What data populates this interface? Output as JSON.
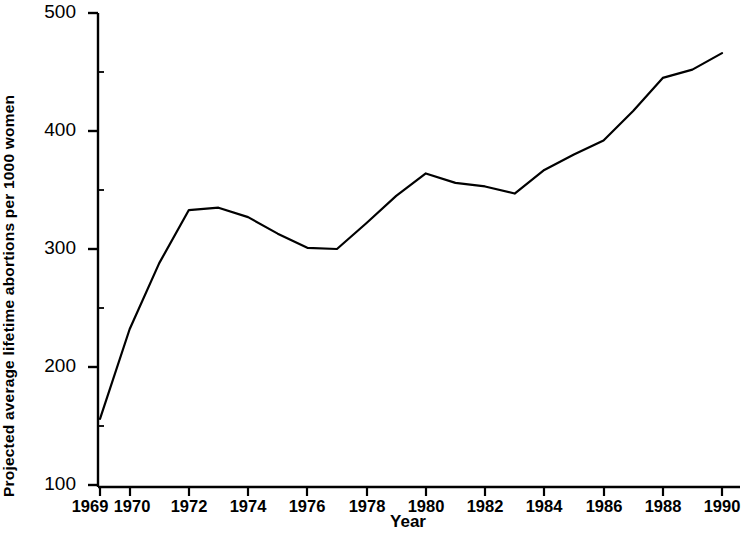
{
  "chart_data": {
    "type": "line",
    "title": "",
    "xlabel": "Year",
    "ylabel": "Projected average lifetime abortions per 1000 women",
    "x": [
      1969,
      1970,
      1971,
      1972,
      1973,
      1974,
      1975,
      1976,
      1977,
      1978,
      1979,
      1980,
      1981,
      1982,
      1983,
      1984,
      1985,
      1986,
      1987,
      1988,
      1989,
      1990
    ],
    "values": [
      156,
      232,
      288,
      333,
      335,
      327,
      313,
      301,
      300,
      322,
      345,
      364,
      356,
      353,
      347,
      367,
      380,
      392,
      417,
      445,
      452,
      466
    ],
    "series": [
      {
        "name": "Projected average lifetime abortions per 1000 women",
        "values": [
          156,
          232,
          288,
          333,
          335,
          327,
          313,
          301,
          300,
          322,
          345,
          364,
          356,
          353,
          347,
          367,
          380,
          392,
          417,
          445,
          452,
          466
        ]
      }
    ],
    "xlim": [
      1969,
      1990
    ],
    "ylim": [
      100,
      500
    ],
    "xticks": [
      1969,
      1970,
      1972,
      1974,
      1976,
      1978,
      1980,
      1982,
      1984,
      1986,
      1988,
      1990
    ],
    "xtick_labels": [
      "1969",
      "1970",
      "1972",
      "1974",
      "1976",
      "1978",
      "1980",
      "1982",
      "1984",
      "1986",
      "1988",
      "1990"
    ],
    "yticks": [
      100,
      200,
      300,
      400,
      500
    ],
    "ytick_labels": [
      "100",
      "200",
      "300",
      "400",
      "500"
    ],
    "grid": false,
    "legend": "none",
    "line_color": "#000000",
    "line_width": 2.2,
    "markers": "none",
    "background_color": "#ffffff",
    "axis_color": "#000000"
  },
  "axes": {
    "y_title": "Projected average lifetime abortions per 1000 women",
    "x_title": "Year"
  }
}
